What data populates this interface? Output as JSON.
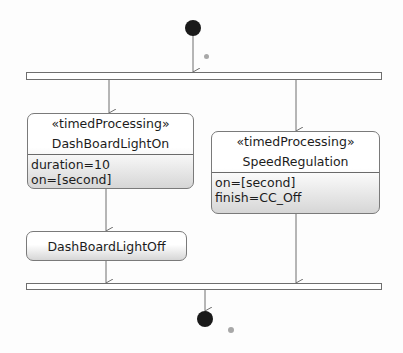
{
  "diagram": {
    "type": "UML activity diagram",
    "initial_node": {
      "label": ""
    },
    "fork_bar": {
      "label": ""
    },
    "join_bar": {
      "label": ""
    },
    "final_node": {
      "label": ""
    },
    "actions": [
      {
        "id": "dashboard-light-on",
        "stereotype": "«timedProcessing»",
        "name": "DashBoardLightOn",
        "attributes": [
          "duration=10",
          "on=[second]"
        ]
      },
      {
        "id": "speed-regulation",
        "stereotype": "«timedProcessing»",
        "name": "SpeedRegulation",
        "attributes": [
          "on=[second]",
          "finish=CC_Off"
        ]
      },
      {
        "id": "dashboard-light-off",
        "stereotype": "",
        "name": "DashBoardLightOff",
        "attributes": []
      }
    ],
    "edges": [
      {
        "from": "initial_node",
        "to": "fork_bar"
      },
      {
        "from": "fork_bar",
        "to": "dashboard-light-on"
      },
      {
        "from": "fork_bar",
        "to": "speed-regulation"
      },
      {
        "from": "dashboard-light-on",
        "to": "dashboard-light-off"
      },
      {
        "from": "dashboard-light-off",
        "to": "join_bar"
      },
      {
        "from": "speed-regulation",
        "to": "join_bar"
      },
      {
        "from": "join_bar",
        "to": "final_node"
      }
    ],
    "colors": {
      "line": "#6e6e6e",
      "node_fill": "#1a1a1a",
      "action_gradient_end": "#d6d6d6"
    }
  }
}
